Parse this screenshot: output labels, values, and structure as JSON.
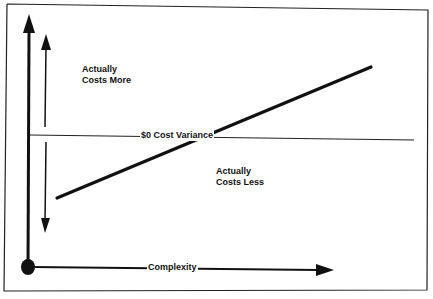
{
  "diagram": {
    "type": "conceptual-cost-variance-diagram",
    "labels": {
      "upper_region_line1": "Actually",
      "upper_region_line2": "Costs More",
      "lower_region_line1": "Actually",
      "lower_region_line2": "Costs Less",
      "zero_line": "$0 Cost Variance",
      "x_axis": "Complexity"
    },
    "colors": {
      "ink": "#111111",
      "background": "#ffffff"
    },
    "trend_line": {
      "from": [
        57,
        198
      ],
      "to": [
        371,
        67
      ]
    }
  }
}
